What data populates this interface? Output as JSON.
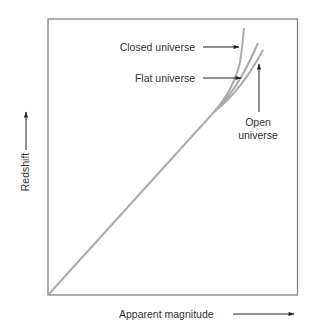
{
  "diagram": {
    "type": "hubble-diagram",
    "axes": {
      "x_label": "Apparent magnitude",
      "y_label": "Redshift"
    },
    "curves": [
      {
        "name": "closed",
        "label": "Closed universe"
      },
      {
        "name": "flat",
        "label": "Flat universe"
      },
      {
        "name": "open",
        "label_line1": "Open",
        "label_line2": "universe"
      }
    ],
    "colors": {
      "frame": "#7a7a7a",
      "curve": "#aaaaaa",
      "arrow": "#222222",
      "text": "#333333"
    }
  }
}
